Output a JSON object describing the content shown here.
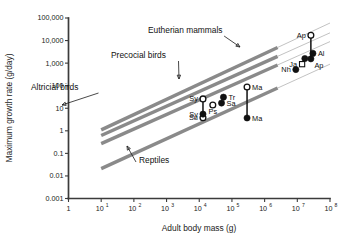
{
  "chart_data": {
    "type": "scatter",
    "title": "",
    "xlabel": "Adult body mass (g)",
    "ylabel": "Maximum growth rate (g/day)",
    "xscale": "log",
    "yscale": "log",
    "xlim": [
      1,
      100000000
    ],
    "ylim": [
      0.001,
      100000
    ],
    "grid": false,
    "legend": "none",
    "xticks": [
      {
        "value": 1,
        "label": "1",
        "mantissa": "",
        "exponent": ""
      },
      {
        "value": 10,
        "label": "10¹",
        "mantissa": "10",
        "exponent": "1"
      },
      {
        "value": 100,
        "label": "10²",
        "mantissa": "10",
        "exponent": "2"
      },
      {
        "value": 1000,
        "label": "10³",
        "mantissa": "10",
        "exponent": "3"
      },
      {
        "value": 10000,
        "label": "10⁴",
        "mantissa": "10",
        "exponent": "4"
      },
      {
        "value": 100000,
        "label": "10⁵",
        "mantissa": "10",
        "exponent": "5"
      },
      {
        "value": 1000000,
        "label": "10⁶",
        "mantissa": "10",
        "exponent": "6"
      },
      {
        "value": 10000000,
        "label": "10⁷",
        "mantissa": "10",
        "exponent": "7"
      },
      {
        "value": 100000000,
        "label": "10⁸",
        "mantissa": "10",
        "exponent": "8"
      }
    ],
    "yticks": [
      {
        "value": 100000,
        "label": "100,000"
      },
      {
        "value": 10000,
        "label": "10,000"
      },
      {
        "value": 1000,
        "label": "1,000"
      },
      {
        "value": 100,
        "label": "100"
      },
      {
        "value": 10,
        "label": "10"
      },
      {
        "value": 1,
        "label": "1"
      },
      {
        "value": 0.1,
        "label": "0.1"
      },
      {
        "value": 0.01,
        "label": "0.01"
      },
      {
        "value": 0.001,
        "label": "0.001"
      }
    ],
    "bands": [
      {
        "name": "Eutherian mammals",
        "label": "Eutherian mammals",
        "x0": 10,
        "y0": 1.1,
        "x1": 100000000,
        "y1": 60000.0,
        "solid_to_x": 2500000
      },
      {
        "name": "Precocial birds",
        "label": "Precocial birds",
        "x0": 10,
        "y0": 0.62,
        "x1": 100000000,
        "y1": 22000.0,
        "solid_to_x": 2500000
      },
      {
        "name": "Altricial birds",
        "label": "Altricial birds",
        "x0": 10,
        "y0": 0.27,
        "x1": 100000000,
        "y1": 9000.0,
        "solid_to_x": 2500000
      },
      {
        "name": "Reptiles",
        "label": "Reptiles",
        "x0": 10,
        "y0": 0.021,
        "x1": 100000000,
        "y1": 900.0,
        "solid_to_x": 2500000
      }
    ],
    "points": [
      {
        "label": "Su",
        "x": 13000,
        "y": 3.8,
        "marker": "open-circle",
        "label_pos": "left"
      },
      {
        "label": "Sy",
        "x": 13000,
        "y": 26.0,
        "marker": "open-circle",
        "label_pos": "left"
      },
      {
        "label": "Sy",
        "x": 13000,
        "y": 5.5,
        "marker": "filled-circle",
        "label_pos": "left"
      },
      {
        "label": "Ps",
        "x": 26000,
        "y": 14.0,
        "marker": "open-circle",
        "label_pos": "below"
      },
      {
        "label": "Sa",
        "x": 48000,
        "y": 17.0,
        "marker": "filled-circle",
        "label_pos": "right"
      },
      {
        "label": "Tr",
        "x": 55000,
        "y": 31.0,
        "marker": "filled-circle",
        "label_pos": "right"
      },
      {
        "label": "Ma",
        "x": 290000,
        "y": 88.0,
        "marker": "open-circle",
        "label_pos": "right"
      },
      {
        "label": "Ma",
        "x": 290000,
        "y": 3.7,
        "marker": "filled-circle",
        "label_pos": "right"
      },
      {
        "label": "Nh",
        "x": 9000000,
        "y": 520.0,
        "marker": "filled-circle",
        "label_pos": "left"
      },
      {
        "label": "Ja",
        "x": 14000000,
        "y": 900.0,
        "marker": "open-square",
        "label_pos": "left"
      },
      {
        "label": "Ap",
        "x": 17000000,
        "y": 1600.0,
        "marker": "filled-circle",
        "label_pos": "none"
      },
      {
        "label": "Ap",
        "x": 26000000,
        "y": 1550.0,
        "marker": "filled-circle",
        "label_pos": "below-right"
      },
      {
        "label": "Al",
        "x": 30000000,
        "y": 2700.0,
        "marker": "filled-circle",
        "label_pos": "right"
      },
      {
        "label": "Ap",
        "x": 26000000,
        "y": 17000.0,
        "marker": "open-circle",
        "label_pos": "left"
      }
    ],
    "connectors": [
      {
        "x": 13000,
        "y0": 26.0,
        "y1": 5.5
      },
      {
        "x": 290000,
        "y0": 88.0,
        "y1": 3.7
      },
      {
        "x": 26000000,
        "y0": 17000.0,
        "y1": 1550.0
      }
    ],
    "annotations": [
      {
        "text": "Eutherian mammals",
        "tx": 148,
        "ty": 33,
        "ax": 240,
        "ay": 47
      },
      {
        "text": "Precocial birds",
        "tx": 111,
        "ty": 58,
        "ax": 179,
        "ay": 79
      },
      {
        "text": "Altricial birds",
        "tx": 31,
        "ty": 90,
        "ax": 62,
        "ay": 105
      },
      {
        "text": "Reptiles",
        "tx": 139,
        "ty": 163,
        "ax": 127,
        "ay": 146
      }
    ]
  }
}
